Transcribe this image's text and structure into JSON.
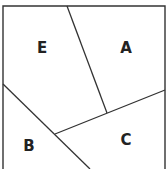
{
  "diagram": {
    "type": "partitioned-square",
    "colors": {
      "stroke": "#333333",
      "background": "#ffffff",
      "label": "#222222"
    },
    "regions": [
      {
        "id": "E",
        "label": "E",
        "x": 42,
        "y": 48
      },
      {
        "id": "A",
        "label": "A",
        "x": 126,
        "y": 48
      },
      {
        "id": "B",
        "label": "B",
        "x": 29,
        "y": 146
      },
      {
        "id": "C",
        "label": "C",
        "x": 126,
        "y": 140
      }
    ]
  }
}
